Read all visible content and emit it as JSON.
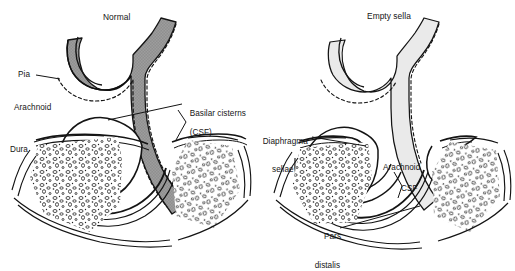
{
  "figure": {
    "kind": "anatomical-line-diagram",
    "background_color": "#ffffff",
    "ink_color": "#151515",
    "panels": [
      {
        "id": "normal",
        "title": "Normal",
        "cistern_fill": "#8f8f8f",
        "labels": [
          {
            "name": "pia",
            "text": "Pia"
          },
          {
            "name": "arachnoid",
            "text": "Arachnoid"
          },
          {
            "name": "dura",
            "text": "Dura"
          },
          {
            "name": "basilar-cisterns",
            "text": "Basilar cisterns",
            "text2": "(CSF)"
          }
        ]
      },
      {
        "id": "empty-sella",
        "title": "Empty sella",
        "cistern_fill": "#e9e9e9",
        "labels": [
          {
            "name": "diaphragma-sellae",
            "text": "Diaphragma",
            "text2": "sellae"
          },
          {
            "name": "arachnoid",
            "text": "Arachnoid"
          },
          {
            "name": "csf",
            "text": "CSF"
          },
          {
            "name": "pars-distalis",
            "text": "Pars",
            "text2": "distalis"
          }
        ]
      }
    ]
  },
  "labels": {
    "normal_title": "Normal",
    "empty_title": "Empty sella",
    "pia": "Pia",
    "arachnoid_left": "Arachnoid",
    "dura": "Dura",
    "basilar_1": "Basilar cisterns",
    "basilar_2": "(CSF)",
    "diaphragma_1": "Diaphragma",
    "diaphragma_2": "sellae",
    "arachnoid_right": "Arachnoid",
    "csf": "CSF",
    "pars_1": "Pars",
    "pars_2": "distalis"
  }
}
